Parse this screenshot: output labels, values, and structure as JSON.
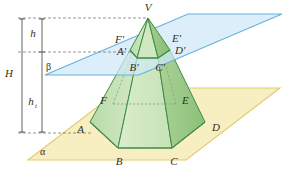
{
  "figure": {
    "colors": {
      "plane_alpha_fill": "#f7eec2",
      "plane_alpha_stroke": "#e0c96a",
      "plane_beta_fill": "#cfe8f7",
      "plane_beta_stroke": "#6bb6dd",
      "solid_fill_light": "#cfe6c0",
      "solid_fill_mid": "#b6d9a4",
      "solid_fill_dark": "#9dcb8c",
      "solid_stroke": "#3f8c46",
      "hidden_stroke": "#6aa06a",
      "measure_line": "#55504a",
      "label_text": "#3a2d17"
    }
  },
  "labels": {
    "apex": "V",
    "base_vertices": [
      "A",
      "B",
      "C",
      "D",
      "E",
      "F"
    ],
    "section_vertices": [
      "A'",
      "B'",
      "C'",
      "D'",
      "E'",
      "F'"
    ],
    "plane_lower": "α",
    "plane_upper": "β",
    "height_total": "H",
    "height_upper": "h",
    "height_lower_base": "h",
    "height_lower_sub": "t"
  },
  "geometry": {
    "plane_alpha": "28,160 122,88 280,88 186,160",
    "plane_beta": "45,75 188,14 282,14 139,75",
    "apex": [
      148,
      18
    ],
    "base_hexagon": {
      "A": [
        90,
        122
      ],
      "B": [
        118,
        148
      ],
      "C": [
        172,
        148
      ],
      "D": [
        205,
        122
      ],
      "E": [
        176,
        104
      ],
      "F": [
        113,
        104
      ]
    },
    "section_hexagon": {
      "Ap": [
        130,
        50
      ],
      "Bp": [
        137,
        58
      ],
      "Cp": [
        158,
        58
      ],
      "Dp": [
        170,
        50
      ],
      "Ep": [
        160,
        43
      ],
      "Fp": [
        136,
        43
      ]
    },
    "measure_axis_H": {
      "x": 22,
      "y_top": 18,
      "y_bottom": 133
    },
    "measure_axis_h": {
      "x": 42,
      "y_top": 18,
      "y_bottom": 52
    },
    "measure_axis_ht": {
      "x": 42,
      "y_top": 52,
      "y_bottom": 133
    }
  }
}
